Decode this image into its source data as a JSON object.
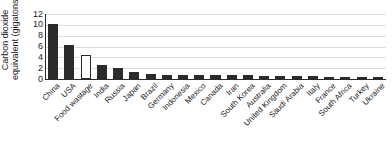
{
  "chart_data": {
    "type": "bar",
    "title": "",
    "subtitle": "",
    "xlabel": "",
    "ylabel": "Carbon dioxide equivalent (gigatons)",
    "ylabel_line1": "Carbon dioxide",
    "ylabel_line2": "equivalent (gigatons)",
    "ylim": [
      0,
      12
    ],
    "yticks": [
      0,
      2,
      4,
      6,
      8,
      10,
      12
    ],
    "ytick_labels": [
      "0",
      "2",
      "4",
      "6",
      "8",
      "10",
      "12"
    ],
    "grid": true,
    "grid_axis": "y",
    "legend": "none",
    "legend_position": "none",
    "annotations": [],
    "bar_color": "#2b2b2b",
    "highlight_color": "#ffffff",
    "highlight_edge_color": "#2b2b2b",
    "categories": [
      "China",
      "USA",
      "Food wastage",
      "India",
      "Russia",
      "Japan",
      "Brazil",
      "Germany",
      "Indonesia",
      "Mexico",
      "Canada",
      "Iran",
      "South Korea",
      "Australia",
      "United Kingdom",
      "Saudi Arabia",
      "Italy",
      "France",
      "South Africa",
      "Turkey",
      "Ukraine"
    ],
    "values": [
      10.2,
      6.2,
      4.4,
      2.6,
      2.0,
      1.3,
      1.0,
      0.8,
      0.8,
      0.7,
      0.7,
      0.65,
      0.65,
      0.6,
      0.55,
      0.55,
      0.5,
      0.45,
      0.45,
      0.4,
      0.35
    ],
    "highlighted_categories": [
      "Food wastage"
    ],
    "series": [
      {
        "name": "Carbon dioxide equivalent",
        "values": [
          10.2,
          6.2,
          4.4,
          2.6,
          2.0,
          1.3,
          1.0,
          0.8,
          0.8,
          0.7,
          0.7,
          0.65,
          0.65,
          0.6,
          0.55,
          0.55,
          0.5,
          0.45,
          0.45,
          0.4,
          0.35
        ]
      }
    ]
  }
}
